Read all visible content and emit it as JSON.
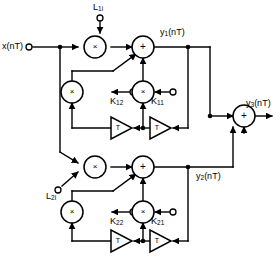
{
  "diagram": {
    "colors": {
      "line": "#000000",
      "background": "#ffffff",
      "text": "#000000"
    },
    "inputs": [
      {
        "id": "x",
        "label": "x(nT)",
        "base": "x",
        "arg": "(nT)"
      },
      {
        "id": "L1i",
        "label": "L1i",
        "base": "L",
        "sub": "1i"
      },
      {
        "id": "L2i",
        "label": "L2i",
        "base": "L",
        "sub": "2i"
      }
    ],
    "outputs": [
      {
        "id": "y1",
        "base": "y",
        "sub": "1",
        "arg": "(nT)"
      },
      {
        "id": "y2",
        "base": "y",
        "sub": "2",
        "arg": "(nT)"
      },
      {
        "id": "y3",
        "base": "y",
        "sub": "3",
        "arg": "(nT)"
      }
    ],
    "coefficients": [
      {
        "id": "K12",
        "base": "K",
        "sub": "12"
      },
      {
        "id": "K11",
        "base": "K",
        "sub": "11"
      },
      {
        "id": "K22",
        "base": "K",
        "sub": "22"
      },
      {
        "id": "K21",
        "base": "K",
        "sub": "21"
      }
    ],
    "operators": {
      "multiply": "×",
      "add": "+",
      "delay": "T"
    },
    "sections": [
      {
        "id": "section-1",
        "name": "upper-section",
        "output": "y1"
      },
      {
        "id": "section-2",
        "name": "lower-section",
        "output": "y2"
      }
    ],
    "delays": [
      {
        "id": "delay-11",
        "label": "T"
      },
      {
        "id": "delay-12",
        "label": "T"
      },
      {
        "id": "delay-21",
        "label": "T"
      },
      {
        "id": "delay-22",
        "label": "T"
      }
    ]
  }
}
